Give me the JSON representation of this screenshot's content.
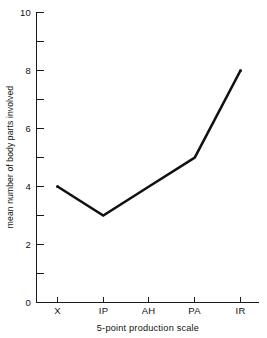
{
  "chart_data": {
    "type": "line",
    "title": "",
    "subtitle": "",
    "categories": [
      "X",
      "IP",
      "AH",
      "PA",
      "IR"
    ],
    "values": [
      4,
      3,
      4,
      5,
      8
    ],
    "xlabel": "5-point production scale",
    "ylabel": "mean number of body parts involved",
    "ylim": [
      0,
      10
    ],
    "ytick_labels": [
      "0",
      "2",
      "4",
      "6",
      "8",
      "10"
    ],
    "ytick_values": [
      0,
      2,
      4,
      6,
      8,
      10
    ],
    "yminor_tick_values": [
      1,
      3,
      5,
      7,
      9
    ],
    "grid": false,
    "legend": null,
    "legend_position": "none",
    "markers": false,
    "line_color": "#111111",
    "background_color": "#ffffff",
    "axis_color": "#1a1a1a"
  },
  "axes": {
    "y_title": "mean number of body parts involved",
    "x_title": "5-point production scale",
    "y_ticks": [
      {
        "label": "10",
        "value": 10
      },
      {
        "label": "8",
        "value": 8
      },
      {
        "label": "6",
        "value": 6
      },
      {
        "label": "4",
        "value": 4
      },
      {
        "label": "2",
        "value": 2
      },
      {
        "label": "0",
        "value": 0
      }
    ],
    "x_ticks": [
      {
        "label": "X",
        "value": 0
      },
      {
        "label": "IP",
        "value": 1
      },
      {
        "label": "AH",
        "value": 2
      },
      {
        "label": "PA",
        "value": 3
      },
      {
        "label": "IR",
        "value": 4
      }
    ]
  }
}
